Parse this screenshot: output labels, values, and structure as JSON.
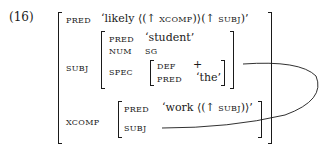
{
  "example_number": "(16)",
  "fstructure": {
    "pred": {
      "attr": "PRED",
      "value_pre": "‘likely ⟨(↑ ",
      "value_sc1": "XCOMP",
      "value_mid": ")⟩(↑ ",
      "value_sc2": "SUBJ",
      "value_post": ")’"
    },
    "subj": {
      "attr": "SUBJ",
      "pred": {
        "attr": "PRED",
        "value": "‘student’"
      },
      "num": {
        "attr": "NUM",
        "value": "SG"
      },
      "spec": {
        "attr": "SPEC",
        "def": {
          "attr": "DEF",
          "value": "+"
        },
        "pred": {
          "attr": "PRED",
          "value": "‘the’"
        }
      }
    },
    "xcomp": {
      "attr": "XCOMP",
      "pred": {
        "attr": "PRED",
        "value_pre": "‘work ⟨(↑ ",
        "value_sc": "SUBJ",
        "value_post": ")⟩’"
      },
      "subj": {
        "attr": "SUBJ"
      }
    }
  }
}
